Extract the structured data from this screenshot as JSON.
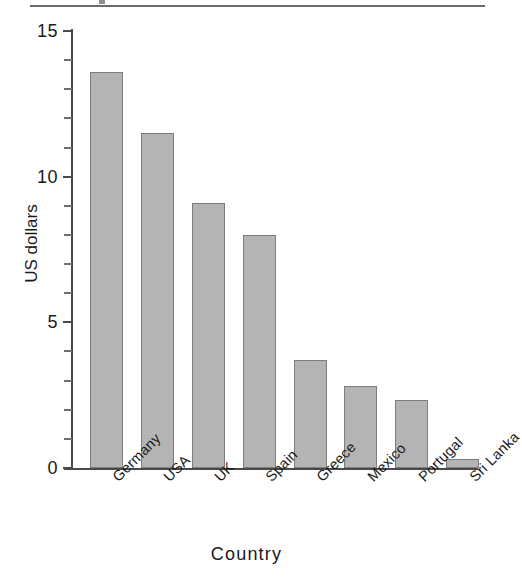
{
  "chart_data": {
    "type": "bar",
    "title": "",
    "subtitle": "",
    "xlabel": "Country",
    "ylabel": "US dollars",
    "categories": [
      "Germany",
      "USA",
      "UK",
      "Spain",
      "Greece",
      "Mexico",
      "Portugal",
      "Sri Lanka"
    ],
    "values": [
      13.6,
      11.5,
      9.1,
      8.0,
      3.7,
      2.8,
      2.35,
      0.3
    ],
    "ylim": [
      0,
      15
    ],
    "xlim_categories": 8,
    "y_major_ticks": [
      0,
      5,
      10,
      15
    ],
    "y_major_tick_labels": [
      "0",
      "5",
      "10",
      "15"
    ],
    "y_minor_tick_interval": 1,
    "grid": false,
    "legend": null,
    "legend_position": "none",
    "bar_fill_color": "#b4b4b4",
    "bar_edge_color": "#7d7d7d",
    "axis_color": "#4a4a4a",
    "text_color": "#1a1a1a",
    "background_color": "#ffffff",
    "xtick_label_rotation": -45,
    "annotations": []
  },
  "decorations": {
    "top_rule_color": "#6b6b6b"
  }
}
